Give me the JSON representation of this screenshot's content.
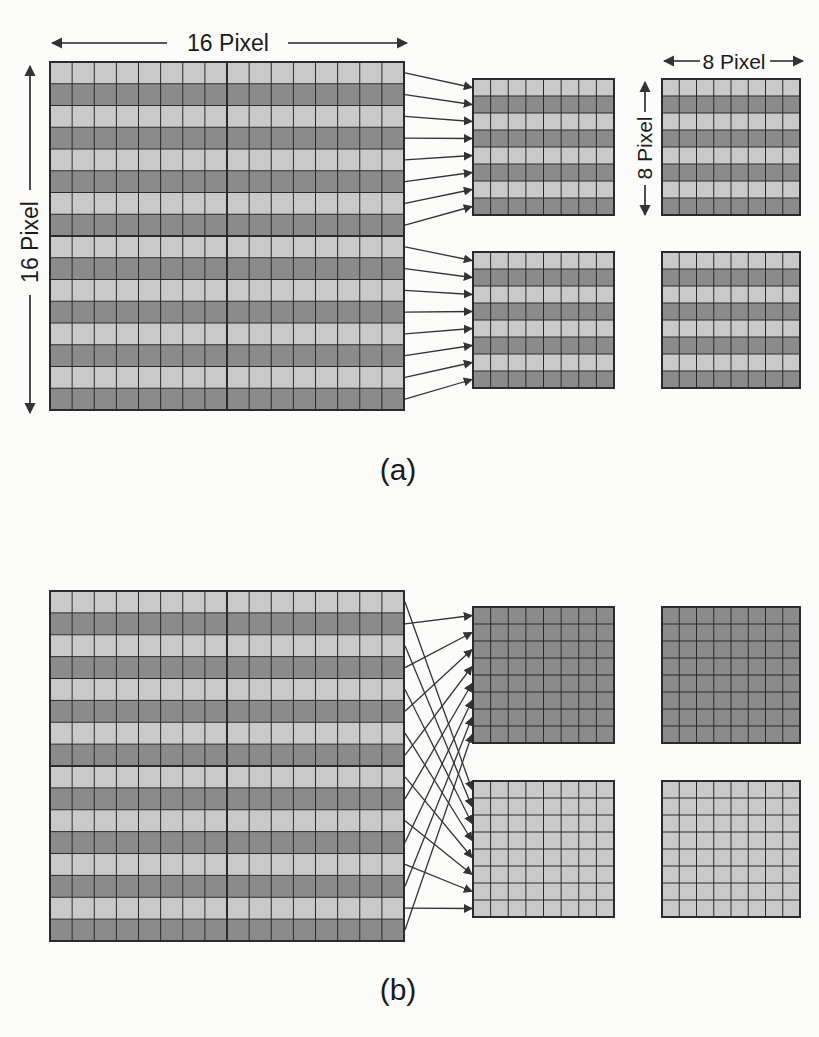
{
  "colors": {
    "light_cell": "#c9c9c9",
    "dark_cell": "#8b8b8b",
    "grid_line": "#2b2b2b",
    "arrow": "#333333",
    "background": "#fbfbfa"
  },
  "labels": {
    "width_16": "16 Pixel",
    "height_16": "16 Pixel",
    "width_8": "8 Pixel",
    "height_8": "8 Pixel",
    "panel_a": "(a)",
    "panel_b": "(b)"
  },
  "panel_a": {
    "caption": "(a)",
    "source_grid": {
      "size": 16,
      "row_pattern": "alternating light/dark, starting light",
      "quadrant_dividers": true
    },
    "description": "16x16 macroblock split into top and bottom 8-row halves; each half maps row-by-row to an 8x8 block",
    "mapping": "source rows 0-7 -> upper block rows 0-7; source rows 8-15 -> lower block rows 0-7",
    "blocks": [
      {
        "name": "upper-middle",
        "rows": "alternating"
      },
      {
        "name": "upper-right",
        "rows": "alternating"
      },
      {
        "name": "lower-middle",
        "rows": "alternating"
      },
      {
        "name": "lower-right",
        "rows": "alternating"
      }
    ]
  },
  "panel_b": {
    "caption": "(b)",
    "source_grid": {
      "size": 16,
      "row_pattern": "alternating light/dark, starting light",
      "quadrant_dividers": true
    },
    "description": "16x16 macroblock split by field: odd (dark) rows form the upper 8x8 block, even (light) rows form the lower 8x8 block",
    "mapping": "dark rows 1,3,...,15 -> upper block rows 0-7; light rows 0,2,...,14 -> lower block rows 0-7",
    "blocks": [
      {
        "name": "upper-middle",
        "rows": "all dark"
      },
      {
        "name": "upper-right",
        "rows": "all dark"
      },
      {
        "name": "lower-middle",
        "rows": "all light"
      },
      {
        "name": "lower-right",
        "rows": "all light"
      }
    ]
  }
}
